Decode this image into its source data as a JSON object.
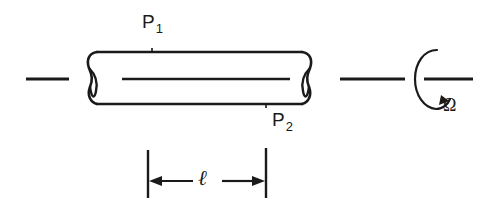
{
  "figure": {
    "stroke_color": "#1a1a1a",
    "background_color": "#ffffff"
  },
  "labels": {
    "p1": {
      "symbol": "P",
      "subscript": "1"
    },
    "p2": {
      "symbol": "P",
      "subscript": "2"
    },
    "omega": "Ω",
    "length": "ℓ"
  },
  "icons": {
    "rotation": "rotation-arrow-icon",
    "dimension": "dimension-arrow-icon"
  }
}
